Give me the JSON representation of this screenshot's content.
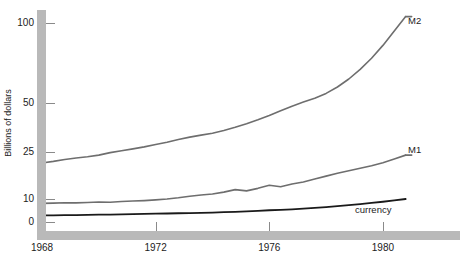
{
  "chart_data": {
    "type": "line",
    "title": "",
    "subtitle": "",
    "xlabel": "",
    "ylabel": "Billions of dollars",
    "yscale": "log-like",
    "grid": false,
    "legend_position": "inline-right-end-of-line",
    "xlim": [
      1968,
      1981.2
    ],
    "ylim": [
      0,
      115
    ],
    "xticks": [
      1968,
      1972,
      1976,
      1980
    ],
    "xticklabels": [
      "1968",
      "1972",
      "1976",
      "1980"
    ],
    "yticks": [
      0,
      10,
      25,
      50,
      100
    ],
    "yticklabels": [
      "0",
      "10",
      "25",
      "50",
      "100"
    ],
    "annotations": [
      {
        "text": "M2",
        "x": 1981.0,
        "y": 105
      },
      {
        "text": "M1",
        "x": 1981.0,
        "y": 24.5
      },
      {
        "text": "currency",
        "x": 1979.0,
        "y": 7.2
      }
    ],
    "series": [
      {
        "name": "M2",
        "color": "#6e6e6e",
        "width": 1.6,
        "x": [
          1968.0,
          1968.4,
          1968.8,
          1969.2,
          1969.6,
          1970.0,
          1970.4,
          1970.8,
          1971.2,
          1971.6,
          1972.0,
          1972.4,
          1972.8,
          1973.2,
          1973.6,
          1974.0,
          1974.4,
          1974.8,
          1975.2,
          1975.6,
          1976.0,
          1976.4,
          1976.8,
          1977.2,
          1977.6,
          1978.0,
          1978.4,
          1978.8,
          1979.2,
          1979.6,
          1980.0,
          1980.4,
          1980.8
        ],
        "values": [
          21.5,
          22.0,
          22.6,
          23.1,
          23.5,
          24.0,
          24.8,
          25.6,
          26.6,
          27.6,
          28.8,
          30.0,
          31.4,
          32.6,
          33.6,
          34.6,
          36.0,
          37.6,
          39.4,
          41.4,
          43.6,
          46.0,
          48.4,
          50.6,
          53.0,
          56.0,
          60.0,
          65.0,
          71.0,
          78.0,
          86.0,
          95.0,
          104.0
        ]
      },
      {
        "name": "M1",
        "color": "#6e6e6e",
        "width": 1.6,
        "x": [
          1968.0,
          1968.4,
          1968.8,
          1969.2,
          1969.6,
          1970.0,
          1970.4,
          1970.8,
          1971.2,
          1971.6,
          1972.0,
          1972.4,
          1972.8,
          1973.2,
          1973.6,
          1974.0,
          1974.4,
          1974.8,
          1975.2,
          1975.6,
          1976.0,
          1976.4,
          1976.8,
          1977.2,
          1977.6,
          1978.0,
          1978.4,
          1978.8,
          1979.2,
          1979.6,
          1980.0,
          1980.4,
          1980.8
        ],
        "values": [
          8.1,
          8.2,
          8.4,
          8.3,
          8.5,
          8.7,
          8.6,
          8.9,
          9.1,
          9.3,
          9.6,
          10.0,
          10.4,
          10.9,
          11.3,
          11.6,
          12.2,
          13.0,
          12.6,
          13.4,
          14.4,
          13.9,
          14.8,
          15.4,
          16.4,
          17.3,
          18.2,
          19.0,
          19.8,
          20.6,
          21.6,
          22.8,
          24.0
        ]
      },
      {
        "name": "currency",
        "color": "#1a1a1a",
        "width": 1.8,
        "x": [
          1968.0,
          1968.4,
          1968.8,
          1969.2,
          1969.6,
          1970.0,
          1970.4,
          1970.8,
          1971.2,
          1971.6,
          1972.0,
          1972.4,
          1972.8,
          1973.2,
          1973.6,
          1974.0,
          1974.4,
          1974.8,
          1975.2,
          1975.6,
          1976.0,
          1976.4,
          1976.8,
          1977.2,
          1977.6,
          1978.0,
          1978.4,
          1978.8,
          1979.2,
          1979.6,
          1980.0,
          1980.4,
          1980.8
        ],
        "values": [
          2.9,
          2.9,
          3.0,
          3.0,
          3.1,
          3.2,
          3.2,
          3.3,
          3.4,
          3.5,
          3.6,
          3.7,
          3.8,
          3.9,
          4.0,
          4.1,
          4.3,
          4.4,
          4.6,
          4.8,
          5.1,
          5.3,
          5.5,
          5.8,
          6.1,
          6.5,
          6.9,
          7.3,
          7.8,
          8.3,
          8.8,
          9.4,
          10.0
        ]
      }
    ]
  },
  "colors": {
    "axis_bar": "#b9b9b9",
    "tick": "#8a8a8a",
    "text": "#1c1c1c",
    "series_gray": "#6e6e6e",
    "series_black": "#1a1a1a",
    "background": "#ffffff"
  }
}
